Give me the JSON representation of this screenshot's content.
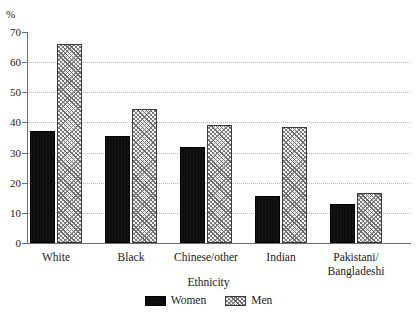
{
  "chart_data": {
    "type": "bar",
    "title": "",
    "xlabel": "Ethnicity",
    "ylabel": "%",
    "ylim": [
      0,
      70
    ],
    "yticks": [
      0,
      10,
      20,
      30,
      40,
      50,
      60,
      70
    ],
    "grid": true,
    "legend_position": "bottom",
    "categories": [
      "White",
      "Black",
      "Chinese/other",
      "Indian",
      "Pakistani/\nBangladeshi"
    ],
    "series": [
      {
        "name": "Women",
        "values": [
          37,
          35.5,
          32,
          15.5,
          13
        ]
      },
      {
        "name": "Men",
        "values": [
          66,
          44.5,
          39,
          38.5,
          16.5
        ]
      }
    ]
  },
  "legend": {
    "items": [
      {
        "label": "Women",
        "style": "solid-black"
      },
      {
        "label": "Men",
        "style": "hatched-grey"
      }
    ]
  },
  "colors": {
    "women_fill": "#0d0d0d",
    "men_fill": "#f2f2f2",
    "men_hatch": "#6b6b6b",
    "gridline": "#b9b9c4",
    "axis": "#6e6e6e",
    "text": "#1a1a1a",
    "background": "#ffffff"
  }
}
